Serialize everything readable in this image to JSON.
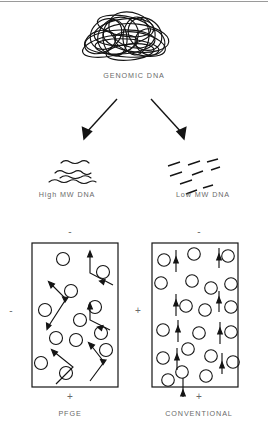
{
  "figure": {
    "type": "diagram",
    "line_color": "#1a1a1a",
    "text_color": "#6a6a6a",
    "background": "#ffffff"
  },
  "source": {
    "label": "GENOMIC DNA",
    "glyph": "tangled-dna-coil"
  },
  "branches": [
    {
      "id": "high-mw",
      "label": "High MW DNA",
      "glyph": "wavy-strands",
      "strand_count": 4
    },
    {
      "id": "low-mw",
      "label": "Low MW DNA",
      "glyph": "short-dashes",
      "fragment_count": 8
    }
  ],
  "gels": [
    {
      "id": "pfge",
      "label": "PFGE",
      "top_polarity": "-",
      "bottom_polarity": "+",
      "side_polarity": "-",
      "migration_path": "zigzag",
      "pore_count": 12,
      "arrow_count": 5
    },
    {
      "id": "conventional",
      "label": "CONVENTIONAL",
      "top_polarity": "-",
      "bottom_polarity": "+",
      "side_polarity": "+",
      "migration_path": "straight-vertical",
      "pore_count": 20,
      "arrow_count": 9
    }
  ]
}
